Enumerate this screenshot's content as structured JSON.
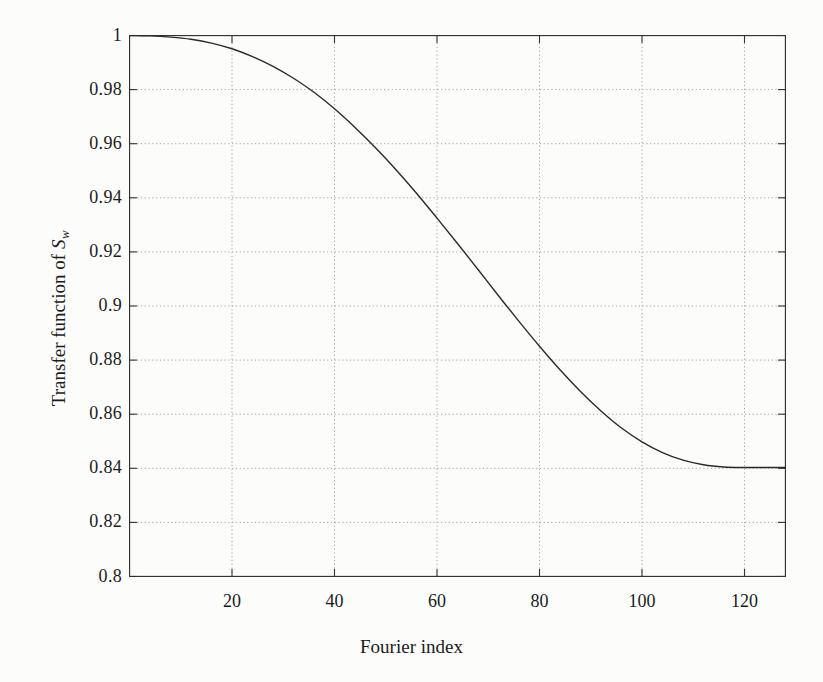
{
  "figure": {
    "background_color": "#fcfcfb",
    "line_color": "#2a2a2a",
    "grid_color": "#9a9a9a",
    "axis_color": "#333333"
  },
  "axis_labels": {
    "x_label": "Fourier index",
    "y_label_prefix": "Transfer function of ",
    "y_label_symbol": "S",
    "y_label_subscript": "w"
  },
  "chart_data": {
    "type": "line",
    "title": "",
    "subtitle": "",
    "xlabel": "Fourier index",
    "ylabel": "Transfer function of S_w",
    "xlim": [
      0,
      128
    ],
    "ylim": [
      0.8,
      1.0
    ],
    "xticks": [
      20,
      40,
      60,
      80,
      100,
      120
    ],
    "xtick_labels": [
      "20",
      "40",
      "60",
      "80",
      "100",
      "120"
    ],
    "yticks": [
      0.8,
      0.82,
      0.84,
      0.86,
      0.88,
      0.9,
      0.92,
      0.94,
      0.96,
      0.98,
      1.0
    ],
    "ytick_labels": [
      "0.8",
      "0.82",
      "0.84",
      "0.86",
      "0.88",
      "0.9",
      "0.92",
      "0.94",
      "0.96",
      "0.98",
      "1"
    ],
    "grid": true,
    "grid_style": "dotted",
    "legend": null,
    "legend_position": "none",
    "series": [
      {
        "name": "Transfer function of S_w",
        "color": "#2a2a2a",
        "linewidth": 1.4,
        "x": [
          0,
          4,
          8,
          12,
          16,
          20,
          24,
          28,
          32,
          36,
          40,
          44,
          48,
          52,
          56,
          60,
          64,
          68,
          72,
          76,
          80,
          84,
          88,
          92,
          96,
          100,
          104,
          108,
          112,
          116,
          120,
          124,
          128
        ],
        "y": [
          1.0,
          0.99985,
          0.9994,
          0.9986,
          0.9972,
          0.9951,
          0.9922,
          0.9886,
          0.9842,
          0.979,
          0.9729,
          0.966,
          0.9585,
          0.9504,
          0.9417,
          0.9325,
          0.9231,
          0.9135,
          0.9038,
          0.8943,
          0.8851,
          0.8764,
          0.8684,
          0.8612,
          0.8549,
          0.8498,
          0.8458,
          0.843,
          0.8413,
          0.8405,
          0.8403,
          0.8403,
          0.8403
        ]
      }
    ]
  }
}
